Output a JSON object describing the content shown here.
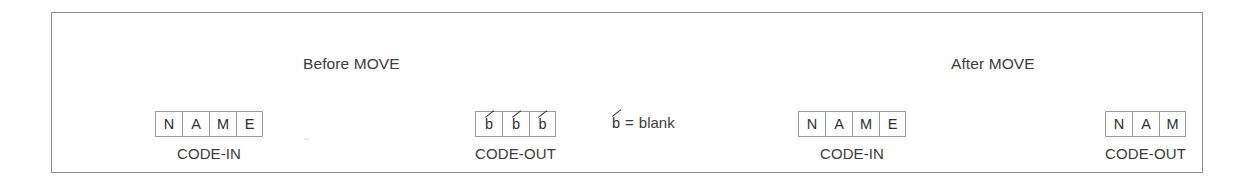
{
  "figure": {
    "border_color": "#8d8d8d",
    "background_color": "#ffffff",
    "cell_border_color": "#9a9a9a",
    "text_color": "#3b3b3b"
  },
  "sections": {
    "before": {
      "caption": "Before MOVE"
    },
    "after": {
      "caption": "After MOVE"
    }
  },
  "legend": {
    "symbol": "b",
    "equals": "=",
    "meaning": "blank"
  },
  "fields": [
    {
      "id": "code-in-before",
      "label": "CODE-IN",
      "section": "before",
      "cells": [
        {
          "char": "N",
          "blank": false
        },
        {
          "char": "A",
          "blank": false
        },
        {
          "char": "M",
          "blank": false
        },
        {
          "char": "E",
          "blank": false
        }
      ]
    },
    {
      "id": "code-out-before",
      "label": "CODE-OUT",
      "section": "before",
      "cells": [
        {
          "char": "b",
          "blank": true
        },
        {
          "char": "b",
          "blank": true
        },
        {
          "char": "b",
          "blank": true
        }
      ]
    },
    {
      "id": "code-in-after",
      "label": "CODE-IN",
      "section": "after",
      "cells": [
        {
          "char": "N",
          "blank": false
        },
        {
          "char": "A",
          "blank": false
        },
        {
          "char": "M",
          "blank": false
        },
        {
          "char": "E",
          "blank": false
        }
      ]
    },
    {
      "id": "code-out-after",
      "label": "CODE-OUT",
      "section": "after",
      "cells": [
        {
          "char": "N",
          "blank": false
        },
        {
          "char": "A",
          "blank": false
        },
        {
          "char": "M",
          "blank": false
        }
      ]
    }
  ]
}
